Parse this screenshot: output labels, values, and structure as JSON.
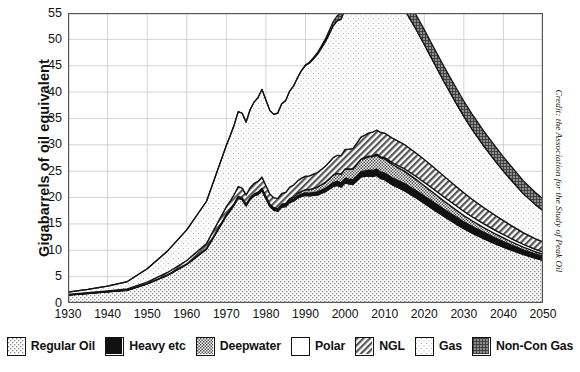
{
  "chart_data": {
    "type": "area",
    "title": "",
    "xlabel": "",
    "ylabel": "Gigabarrels of oil equivalent",
    "xlim": [
      1930,
      2050
    ],
    "ylim": [
      0,
      55
    ],
    "ytick_step": 5,
    "xtick_step": 10,
    "grid": true,
    "stacked": true,
    "legend_position": "bottom",
    "credit": "Credit: the Association for the Study of Peak Oil",
    "ytick_labels": [
      "0",
      "5",
      "10",
      "15",
      "20",
      "25",
      "30",
      "35",
      "40",
      "45",
      "50",
      "55"
    ],
    "xtick_labels": [
      "1930",
      "1940",
      "1950",
      "1960",
      "1970",
      "1980",
      "1990",
      "2000",
      "2010",
      "2020",
      "2030",
      "2040",
      "2050"
    ],
    "x": [
      1930,
      1935,
      1940,
      1945,
      1950,
      1955,
      1960,
      1965,
      1970,
      1971,
      1972,
      1973,
      1974,
      1975,
      1976,
      1977,
      1978,
      1979,
      1980,
      1981,
      1982,
      1983,
      1984,
      1985,
      1986,
      1987,
      1988,
      1989,
      1990,
      1991,
      1992,
      1993,
      1994,
      1995,
      1996,
      1997,
      1998,
      1999,
      2000,
      2001,
      2002,
      2003,
      2004,
      2005,
      2006,
      2007,
      2008,
      2009,
      2010,
      2012,
      2015,
      2018,
      2020,
      2022,
      2025,
      2028,
      2030,
      2032,
      2035,
      2038,
      2040,
      2042,
      2045,
      2048,
      2050
    ],
    "series": [
      {
        "name": "Regular Oil",
        "pattern": "light-stipple",
        "color": "#e6e6e6",
        "values": [
          1.5,
          1.8,
          2.1,
          2.4,
          3.6,
          5.2,
          7.3,
          10.2,
          16.5,
          17.5,
          18.6,
          19.9,
          19.6,
          18.4,
          19.6,
          20.3,
          20.6,
          21.3,
          19.8,
          18.3,
          17.6,
          17.4,
          18.2,
          18.3,
          19.1,
          19.3,
          19.9,
          20.2,
          20.4,
          20.3,
          20.4,
          20.5,
          20.8,
          21.1,
          21.6,
          22.1,
          22.3,
          22.0,
          22.8,
          22.6,
          22.5,
          23.2,
          23.9,
          24.0,
          24.1,
          24.0,
          24.2,
          23.6,
          23.4,
          22.4,
          21.3,
          19.9,
          18.9,
          17.9,
          16.4,
          15.0,
          14.1,
          13.3,
          12.2,
          11.2,
          10.6,
          10.0,
          9.2,
          8.5,
          8.1
        ]
      },
      {
        "name": "Heavy etc",
        "pattern": "solid-black",
        "color": "#111111",
        "values": [
          0.05,
          0.05,
          0.06,
          0.07,
          0.08,
          0.1,
          0.12,
          0.15,
          0.25,
          0.26,
          0.27,
          0.3,
          0.3,
          0.29,
          0.31,
          0.33,
          0.34,
          0.36,
          0.34,
          0.33,
          0.33,
          0.34,
          0.36,
          0.37,
          0.4,
          0.42,
          0.45,
          0.48,
          0.5,
          0.52,
          0.55,
          0.58,
          0.62,
          0.66,
          0.7,
          0.75,
          0.78,
          0.8,
          0.86,
          0.88,
          0.9,
          0.95,
          1.0,
          1.05,
          1.1,
          1.15,
          1.2,
          1.22,
          1.25,
          1.3,
          1.35,
          1.38,
          1.4,
          1.4,
          1.38,
          1.34,
          1.3,
          1.26,
          1.2,
          1.12,
          1.06,
          1.0,
          0.9,
          0.82,
          0.78
        ]
      },
      {
        "name": "Deepwater",
        "pattern": "mid-checker",
        "color": "#9a9a9a",
        "values": [
          0,
          0,
          0,
          0,
          0,
          0,
          0,
          0,
          0.02,
          0.02,
          0.03,
          0.04,
          0.05,
          0.05,
          0.06,
          0.07,
          0.08,
          0.1,
          0.11,
          0.12,
          0.14,
          0.16,
          0.2,
          0.24,
          0.3,
          0.36,
          0.44,
          0.52,
          0.6,
          0.68,
          0.78,
          0.88,
          1.0,
          1.12,
          1.26,
          1.4,
          1.52,
          1.64,
          1.8,
          1.92,
          2.04,
          2.18,
          2.32,
          2.44,
          2.54,
          2.62,
          2.66,
          2.68,
          2.66,
          2.56,
          2.36,
          2.12,
          1.96,
          1.8,
          1.56,
          1.34,
          1.2,
          1.08,
          0.92,
          0.78,
          0.7,
          0.62,
          0.52,
          0.44,
          0.4
        ]
      },
      {
        "name": "Polar",
        "pattern": "white",
        "color": "#ffffff",
        "values": [
          0,
          0,
          0,
          0,
          0,
          0,
          0,
          0,
          0,
          0,
          0,
          0,
          0,
          0,
          0,
          0,
          0,
          0,
          0,
          0,
          0,
          0,
          0,
          0,
          0,
          0,
          0,
          0,
          0,
          0,
          0,
          0,
          0,
          0,
          0,
          0,
          0,
          0,
          0,
          0.02,
          0.03,
          0.05,
          0.07,
          0.09,
          0.12,
          0.15,
          0.18,
          0.22,
          0.26,
          0.34,
          0.46,
          0.58,
          0.66,
          0.72,
          0.78,
          0.8,
          0.8,
          0.78,
          0.74,
          0.68,
          0.64,
          0.6,
          0.52,
          0.46,
          0.42
        ]
      },
      {
        "name": "NGL",
        "pattern": "diagonal-hatch",
        "color": "#6f6f6f",
        "values": [
          0.1,
          0.12,
          0.15,
          0.2,
          0.3,
          0.45,
          0.65,
          0.95,
          1.5,
          1.6,
          1.72,
          1.86,
          1.84,
          1.76,
          1.88,
          1.98,
          2.04,
          2.14,
          2.04,
          1.94,
          1.9,
          1.92,
          2.02,
          2.08,
          2.2,
          2.28,
          2.38,
          2.48,
          2.56,
          2.62,
          2.7,
          2.8,
          2.92,
          3.04,
          3.18,
          3.32,
          3.42,
          3.5,
          3.68,
          3.76,
          3.84,
          4.0,
          4.16,
          4.28,
          4.4,
          4.5,
          4.58,
          4.62,
          4.66,
          4.66,
          4.58,
          4.44,
          4.32,
          4.18,
          3.94,
          3.68,
          3.5,
          3.32,
          3.06,
          2.8,
          2.62,
          2.46,
          2.2,
          1.98,
          1.86
        ]
      },
      {
        "name": "Gas",
        "pattern": "very-light-stipple",
        "color": "#f2f2f2",
        "values": [
          0.4,
          0.6,
          0.9,
          1.4,
          2.5,
          4.0,
          5.8,
          8.0,
          11.6,
          12.4,
          13.2,
          14.2,
          14.2,
          13.8,
          14.8,
          15.4,
          15.9,
          16.6,
          16.2,
          15.8,
          15.8,
          16.2,
          17.0,
          17.4,
          18.2,
          18.8,
          19.6,
          20.4,
          21.0,
          21.4,
          21.9,
          22.4,
          23.0,
          23.6,
          24.3,
          25.0,
          25.5,
          25.9,
          26.6,
          26.9,
          27.2,
          27.8,
          28.4,
          28.8,
          29.2,
          29.4,
          29.4,
          29.2,
          28.8,
          27.6,
          25.6,
          23.4,
          21.8,
          20.2,
          17.9,
          15.8,
          14.5,
          13.3,
          11.7,
          10.3,
          9.4,
          8.6,
          7.4,
          6.5,
          6.0
        ]
      },
      {
        "name": "Non-Con Gas",
        "pattern": "dark-crosshatch",
        "color": "#7d7d7d",
        "values": [
          0,
          0,
          0,
          0,
          0,
          0,
          0,
          0,
          0,
          0,
          0,
          0,
          0,
          0,
          0,
          0,
          0,
          0,
          0,
          0,
          0,
          0,
          0,
          0,
          0,
          0,
          0,
          0.05,
          0.1,
          0.16,
          0.22,
          0.3,
          0.4,
          0.52,
          0.66,
          0.82,
          0.96,
          1.1,
          1.3,
          1.44,
          1.58,
          1.76,
          1.94,
          2.1,
          2.24,
          2.36,
          2.46,
          2.52,
          2.56,
          2.62,
          2.7,
          2.76,
          2.8,
          2.84,
          2.88,
          2.9,
          2.9,
          2.88,
          2.84,
          2.76,
          2.7,
          2.62,
          2.46,
          2.3,
          2.2
        ]
      }
    ],
    "totals": [
      2.05,
      2.57,
      3.21,
      4.07,
      6.48,
      9.75,
      13.87,
      19.3,
      29.87,
      31.78,
      33.82,
      36.3,
      35.99,
      34.3,
      36.65,
      38.08,
      38.86,
      40.5,
      38.49,
      36.49,
      35.77,
      36.32,
      37.78,
      38.39,
      40.2,
      41.16,
      42.77,
      44.13,
      45.16,
      45.78,
      46.55,
      47.46,
      48.74,
      50.0,
      51.7,
      53.39,
      54.48,
      54.94,
      57.04,
      57.52,
      58.09,
      59.94,
      61.79,
      62.76,
      63.7,
      64.18,
      64.68,
      63.86,
      63.59,
      61.48,
      58.35,
      54.58,
      51.84,
      49.04,
      44.83,
      40.86,
      38.31,
      35.91,
      32.58,
      29.66,
      27.72,
      25.9,
      22.14,
      20.16,
      18.96
    ],
    "peak": {
      "year": 2010,
      "value": 54.5
    }
  },
  "axis": {
    "ytitle": "Gigabarrels of oil equivalent"
  },
  "legend": {
    "items": [
      {
        "label": "Regular Oil",
        "pattern": "light-stipple"
      },
      {
        "label": "Heavy etc",
        "pattern": "solid-black"
      },
      {
        "label": "Deepwater",
        "pattern": "mid-checker"
      },
      {
        "label": "Polar",
        "pattern": "white"
      },
      {
        "label": "NGL",
        "pattern": "diagonal-hatch"
      },
      {
        "label": "Gas",
        "pattern": "very-light-stipple"
      },
      {
        "label": "Non-Con Gas",
        "pattern": "dark-crosshatch"
      }
    ]
  },
  "credit": {
    "text": "Credit: the Association for the Study of Peak Oil"
  }
}
